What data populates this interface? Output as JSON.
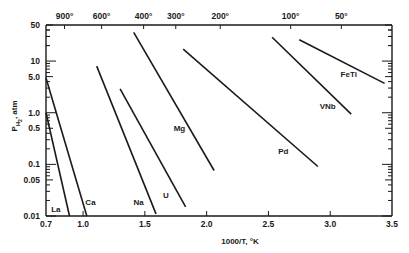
{
  "chart_data": {
    "type": "line",
    "title": "",
    "xlabel": "1000/T, °K",
    "ylabel": "P_H2, atm",
    "xscale": "linear",
    "yscale": "log",
    "xlim": [
      0.7,
      3.5
    ],
    "ylim": [
      0.01,
      50
    ],
    "grid": false,
    "legend": "inline labels",
    "x_ticks": [
      0.7,
      1.0,
      1.5,
      2.0,
      2.5,
      3.0,
      3.5
    ],
    "x_tick_labels": [
      "0.7",
      "1.0",
      "1.5",
      "2.0",
      "2.5",
      "3.0",
      "3.5"
    ],
    "y_ticks": [
      50,
      10,
      5.0,
      1.0,
      0.5,
      0.1,
      0.05,
      0.01
    ],
    "y_tick_labels": [
      "50",
      "10",
      "5.0",
      "1.0",
      "0.5",
      "0.1",
      "0.05",
      "0.01"
    ],
    "top_axis": {
      "label": "Temperature (°C)",
      "ticks": [
        {
          "label": "900°",
          "x": 0.85
        },
        {
          "label": "600°",
          "x": 1.15
        },
        {
          "label": "400°",
          "x": 1.49
        },
        {
          "label": "300°",
          "x": 1.75
        },
        {
          "label": "200°",
          "x": 2.11
        },
        {
          "label": "100°",
          "x": 2.68
        },
        {
          "label": "50°",
          "x": 3.09
        }
      ]
    },
    "series": [
      {
        "name": "La",
        "x": [
          0.7,
          0.89
        ],
        "y": [
          1.0,
          0.01
        ],
        "label_at": [
          0.78,
          0.012
        ]
      },
      {
        "name": "Ca",
        "x": [
          0.7,
          1.03
        ],
        "y": [
          4.7,
          0.01
        ],
        "label_at": [
          1.06,
          0.016
        ]
      },
      {
        "name": "Na",
        "x": [
          1.11,
          1.59
        ],
        "y": [
          8.0,
          0.011
        ],
        "label_at": [
          1.45,
          0.016
        ]
      },
      {
        "name": "U",
        "x": [
          1.3,
          1.83
        ],
        "y": [
          2.9,
          0.015
        ],
        "label_at": [
          1.67,
          0.022
        ]
      },
      {
        "name": "Mg",
        "x": [
          1.41,
          2.06
        ],
        "y": [
          36,
          0.076
        ],
        "label_at": [
          1.78,
          0.45
        ]
      },
      {
        "name": "Pd",
        "x": [
          1.81,
          2.9
        ],
        "y": [
          17,
          0.091
        ],
        "label_at": [
          2.62,
          0.16
        ]
      },
      {
        "name": "VNb",
        "x": [
          2.53,
          3.17
        ],
        "y": [
          29,
          0.94
        ],
        "label_at": [
          2.98,
          1.2
        ]
      },
      {
        "name": "FeTi",
        "x": [
          2.75,
          3.44
        ],
        "y": [
          26,
          3.7
        ],
        "label_at": [
          3.15,
          5.0
        ]
      }
    ]
  }
}
